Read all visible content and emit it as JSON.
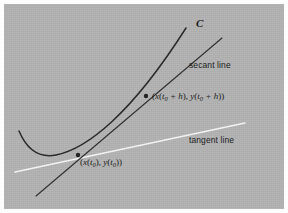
{
  "figure": {
    "kind": "calculus-diagram",
    "background_color": "#b3b3b3",
    "page_color": "#fdfdfd",
    "ink_color": "#2a2a2a",
    "tangent_color": "#f2f2f2",
    "labels": {
      "curve": "C",
      "secant_line": "secant line",
      "tangent_line": "tangent line",
      "point_upper": "(x(t0 + h), y(t0 + h))",
      "point_lower": "(x(t0), y(t0))"
    },
    "point_upper_parts": {
      "open": "(",
      "x": "x",
      "arg_open": "(",
      "t": "t",
      "sub": "0",
      "plus_h": " + h",
      "arg_close": ")",
      "comma": ", ",
      "y": "y",
      "close": ")"
    },
    "point_lower_parts": {
      "open": "(",
      "x": "x",
      "arg_open": "(",
      "t": "t",
      "sub": "0",
      "arg_close": ")",
      "comma": ", ",
      "y": "y",
      "close": ")"
    },
    "geometry": {
      "curve_path": "M 19,131 C 27,150 40,158 56,155 C 86,149 130,116 186,28",
      "secant_path": "M 36,196 L 222,38",
      "tangent_path": "M 15,172 L 245,123",
      "point_upper_xy": [
        146,
        96
      ],
      "point_lower_xy": [
        78,
        155
      ],
      "point_radius": 2.2,
      "curve_stroke_width": 1.5,
      "secant_stroke_width": 1.1,
      "tangent_stroke_width": 1.6
    }
  }
}
